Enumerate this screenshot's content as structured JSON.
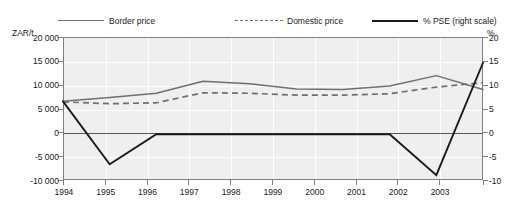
{
  "legend": {
    "entries": [
      {
        "label": "Border price",
        "style": "solid-gray",
        "color": "#6f6f6f"
      },
      {
        "label": "Domestic price",
        "style": "dashed-gray",
        "color": "#6f6f6f"
      },
      {
        "label": "% PSE (right scale)",
        "style": "solid-black",
        "color": "#1a1a1a"
      }
    ]
  },
  "axes": {
    "left_unit": "ZAR/t",
    "right_unit": "%",
    "left_ticks": [
      "20 000",
      "15 000",
      "10 000",
      "5 000",
      "0",
      "-5 000",
      "-10 000"
    ],
    "right_ticks": [
      "20",
      "15",
      "10",
      "5",
      "0",
      "-5",
      "-10"
    ],
    "x_ticks": [
      "1994",
      "1995",
      "1996",
      "1997",
      "1998",
      "1999",
      "2000",
      "2001",
      "2002",
      "2003"
    ]
  },
  "chart_data": {
    "type": "line",
    "title": "",
    "xlabel": "",
    "ylabel": "ZAR/t",
    "y2label": "%",
    "categories": [
      1994,
      1995,
      1996,
      1997,
      1998,
      1999,
      2000,
      2001,
      2002,
      2003
    ],
    "ylim": [
      -10000,
      20000
    ],
    "y2lim": [
      -10,
      20
    ],
    "ytick_values": [
      20000,
      15000,
      10000,
      5000,
      0,
      -5000,
      -10000
    ],
    "y2tick_values": [
      20,
      15,
      10,
      5,
      0,
      -5,
      -10
    ],
    "grid": true,
    "legend_position": "top",
    "series": [
      {
        "name": "Border price",
        "axis": "left",
        "style": "solid",
        "color": "#6f6f6f",
        "values": [
          6500,
          7300,
          8200,
          10700,
          10200,
          9100,
          9000,
          9700,
          11900,
          9000
        ]
      },
      {
        "name": "Domestic price",
        "axis": "left",
        "style": "dashed",
        "color": "#6f6f6f",
        "values": [
          6400,
          6000,
          6200,
          8300,
          8200,
          7800,
          7800,
          8100,
          9500,
          10400
        ]
      },
      {
        "name": "% PSE (right scale)",
        "axis": "right",
        "style": "solid",
        "color": "#1a1a1a",
        "values": [
          6.5,
          -6.7,
          -0.4,
          -0.4,
          -0.4,
          -0.4,
          -0.4,
          -0.4,
          -9.0,
          14.6
        ]
      }
    ]
  }
}
